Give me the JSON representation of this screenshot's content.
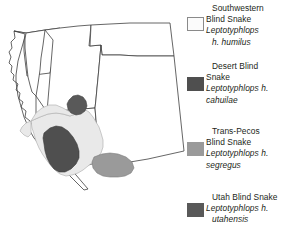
{
  "figure": {
    "kind": "species-range-map",
    "region": "Southwestern United States",
    "background_color": "#ffffff"
  },
  "map": {
    "name": "southwestern-us-range-map",
    "outline_color": "#3f3f3f",
    "state_fill": "#ffffff",
    "states": [
      {
        "id": "california",
        "label": ""
      },
      {
        "id": "nevada",
        "label": ""
      },
      {
        "id": "oregon-idaho",
        "label": ""
      },
      {
        "id": "utah",
        "label": ""
      },
      {
        "id": "arizona",
        "label": ""
      },
      {
        "id": "colorado",
        "label": ""
      },
      {
        "id": "new-mexico",
        "label": ""
      },
      {
        "id": "texas",
        "label": ""
      }
    ],
    "ranges": [
      {
        "id": "range-humilus",
        "taxon_key": "humilus",
        "color": "#e9e9e9"
      },
      {
        "id": "range-cahuilae",
        "taxon_key": "cahuilae",
        "color": "#4f4f4f"
      },
      {
        "id": "range-segregus",
        "taxon_key": "segregus",
        "color": "#9a9a9a"
      },
      {
        "id": "range-utahensis",
        "taxon_key": "utahensis",
        "color": "#595959"
      }
    ]
  },
  "legend": {
    "entries": [
      {
        "key": "humilus",
        "swatch_color": "#fbfbfb",
        "swatch_border": "#8a8a8a",
        "common_line1": "Southwestern",
        "common_line2": "Blind Snake",
        "sci_line1": "Leptotyphlops",
        "sci_line2": "h. humilus"
      },
      {
        "key": "cahuilae",
        "swatch_color": "#4f4f4f",
        "swatch_border": "#4f4f4f",
        "common_line1": "Desert Blind",
        "common_line2": "Snake",
        "sci_line1": "Leptotyphlops  h.",
        "sci_line2": "cahuilae"
      },
      {
        "key": "segregus",
        "swatch_color": "#9a9a9a",
        "swatch_border": "#9a9a9a",
        "common_line1": "Trans-Pecos",
        "common_line2": "Blind Snake",
        "sci_line1": "Leptotyphlops h.",
        "sci_line2": "segregus"
      },
      {
        "key": "utahensis",
        "swatch_color": "#595959",
        "swatch_border": "#595959",
        "common_line1": "Utah Blind Snake",
        "common_line2": "",
        "sci_line1": "Leptotyphlops h.",
        "sci_line2": "utahensis"
      }
    ]
  }
}
